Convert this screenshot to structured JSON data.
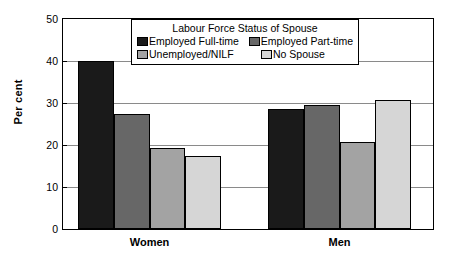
{
  "chart_data": {
    "type": "bar",
    "title": "",
    "xlabel": "",
    "ylabel": "Per cent",
    "ylim": [
      0,
      50
    ],
    "yticks": [
      0,
      10,
      20,
      30,
      40,
      50
    ],
    "ytick_labels": [
      "0",
      "10",
      "20",
      "30",
      "40",
      "50"
    ],
    "grid": true,
    "categories": [
      "Women",
      "Men"
    ],
    "legend_title": "Labour Force Status of Spouse",
    "legend_position": "top-center-inside",
    "series": [
      {
        "name": "Employed Full-time",
        "color": "#1a1a1a",
        "values": [
          40.1,
          28.5
        ]
      },
      {
        "name": "Employed Part-time",
        "color": "#676767",
        "values": [
          27.3,
          29.6
        ]
      },
      {
        "name": "Unemployed/NILF",
        "color": "#a3a3a3",
        "values": [
          19.4,
          20.7
        ]
      },
      {
        "name": "No Spouse",
        "color": "#d6d6d6",
        "values": [
          17.4,
          30.7
        ]
      }
    ]
  },
  "axis": {
    "y_title": "Per cent",
    "y_ticks": [
      {
        "label": "50",
        "value": 50
      },
      {
        "label": "40",
        "value": 40
      },
      {
        "label": "30",
        "value": 30
      },
      {
        "label": "20",
        "value": 20
      },
      {
        "label": "10",
        "value": 10
      },
      {
        "label": "0",
        "value": 0
      }
    ],
    "x_labels": [
      {
        "label": "Women"
      },
      {
        "label": "Men"
      }
    ]
  },
  "legend": {
    "title": "Labour Force Status of Spouse",
    "items": [
      {
        "label": "Employed Full-time",
        "color": "#1a1a1a"
      },
      {
        "label": "Employed Part-time",
        "color": "#676767"
      },
      {
        "label": "Unemployed/NILF",
        "color": "#a3a3a3"
      },
      {
        "label": "No Spouse",
        "color": "#d6d6d6"
      }
    ]
  }
}
